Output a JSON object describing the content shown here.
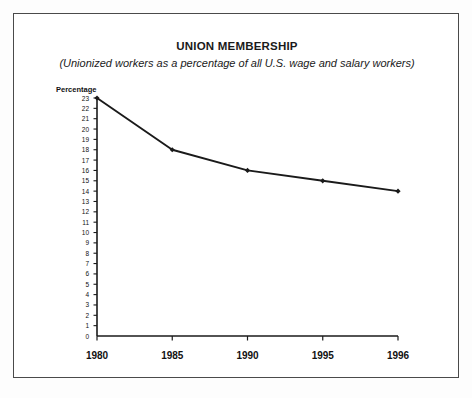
{
  "chart_data": {
    "type": "line",
    "title": "UNION MEMBERSHIP",
    "subtitle": "(Unionized workers as a percentage of all U.S. wage and salary workers)",
    "ylabel": "Percentage",
    "xlabel": "",
    "categories": [
      "1980",
      "1985",
      "1990",
      "1995",
      "1996"
    ],
    "x": [
      1980,
      1985,
      1990,
      1995,
      1996
    ],
    "values": [
      23,
      18,
      16,
      15,
      14
    ],
    "series": [
      {
        "name": "Percentage of unionized workers",
        "values": [
          23,
          18,
          16,
          15,
          14
        ]
      }
    ],
    "ylim": [
      0,
      23
    ],
    "ytick_labels": [
      "23",
      "22",
      "21",
      "20",
      "19",
      "18",
      "17",
      "16",
      "15",
      "14",
      "13",
      "12",
      "11",
      "10",
      "9",
      "8",
      "7",
      "6",
      "5",
      "4",
      "3",
      "2",
      "1",
      "0"
    ],
    "xtick_labels": [
      "1980",
      "1985",
      "1990",
      "1995",
      "1996"
    ],
    "grid": false,
    "legend": null,
    "legend_position": "none",
    "marker": "diamond",
    "line_color": "#1a1a1a",
    "axis_color": "#1a1a1a",
    "background_color": "#ffffff",
    "border_color": "#4a4a4a",
    "note": "X-axis categories are evenly spaced although the final interval spans one year."
  },
  "ylabel_head": "Percentage"
}
